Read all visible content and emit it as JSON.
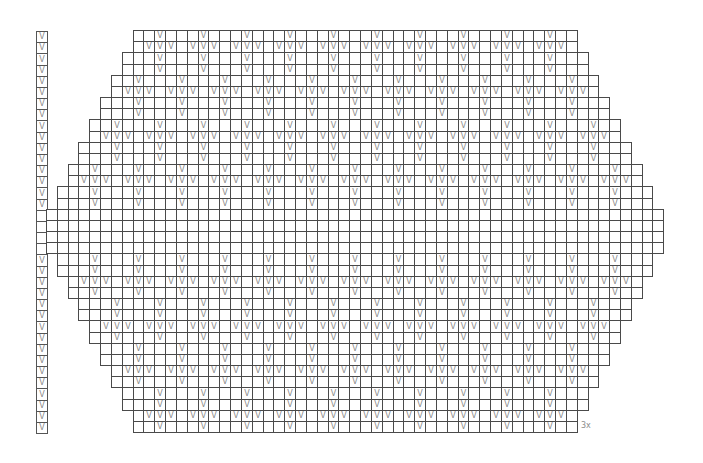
{
  "chart": {
    "title": "",
    "type": "knitting-stitch-chart",
    "cell_symbol": "V",
    "symbol_color": "#8a8a8a",
    "grid_line_color": "#4a4a4a",
    "repeat_label": "3x",
    "geometry": {
      "origin_x": 47,
      "origin_y": 31,
      "cell_w": 10.83,
      "cell_h": 11.17,
      "side_column_x": 36,
      "total_cols": 57,
      "total_rows": 36
    },
    "side_column": {
      "rows_with_v": [
        0,
        1,
        2,
        3,
        4,
        5,
        6,
        7,
        8,
        9,
        10,
        11,
        12,
        13,
        14,
        15,
        20,
        21,
        22,
        23,
        24,
        25,
        26,
        27,
        28,
        29,
        30,
        31,
        32,
        33,
        34,
        35
      ],
      "blank_rows": [
        16,
        17,
        18,
        19
      ]
    },
    "rows": [
      {
        "r": 0,
        "start": 8,
        "end": 48,
        "v": [
          10,
          14,
          18,
          22,
          26,
          30,
          34,
          38,
          42,
          46
        ]
      },
      {
        "r": 1,
        "start": 8,
        "end": 48,
        "v": [
          9,
          10,
          11,
          13,
          14,
          15,
          17,
          18,
          19,
          21,
          22,
          23,
          25,
          26,
          27,
          29,
          30,
          31,
          33,
          34,
          35,
          37,
          38,
          39,
          41,
          42,
          43,
          45,
          46,
          47
        ]
      },
      {
        "r": 2,
        "start": 7,
        "end": 49,
        "v": [
          10,
          14,
          18,
          22,
          26,
          30,
          34,
          38,
          42,
          46
        ]
      },
      {
        "r": 3,
        "start": 7,
        "end": 49,
        "v": [
          10,
          14,
          18,
          22,
          26,
          30,
          34,
          38,
          42,
          46
        ]
      },
      {
        "r": 4,
        "start": 6,
        "end": 50,
        "v": [
          8,
          12,
          16,
          20,
          24,
          28,
          32,
          36,
          40,
          44,
          48
        ]
      },
      {
        "r": 5,
        "start": 6,
        "end": 50,
        "v": [
          7,
          8,
          9,
          11,
          12,
          13,
          15,
          16,
          17,
          19,
          20,
          21,
          23,
          24,
          25,
          27,
          28,
          29,
          31,
          32,
          33,
          35,
          36,
          37,
          39,
          40,
          41,
          43,
          44,
          45,
          47,
          48,
          49
        ]
      },
      {
        "r": 6,
        "start": 5,
        "end": 51,
        "v": [
          8,
          12,
          16,
          20,
          24,
          28,
          32,
          36,
          40,
          44,
          48
        ]
      },
      {
        "r": 7,
        "start": 5,
        "end": 51,
        "v": [
          8,
          12,
          16,
          20,
          24,
          28,
          32,
          36,
          40,
          44,
          48
        ]
      },
      {
        "r": 8,
        "start": 4,
        "end": 52,
        "v": [
          6,
          10,
          14,
          18,
          22,
          26,
          30,
          34,
          38,
          42,
          46,
          50
        ]
      },
      {
        "r": 9,
        "start": 4,
        "end": 52,
        "v": [
          5,
          6,
          7,
          9,
          10,
          11,
          13,
          14,
          15,
          17,
          18,
          19,
          21,
          22,
          23,
          25,
          26,
          27,
          29,
          30,
          31,
          33,
          34,
          35,
          37,
          38,
          39,
          41,
          42,
          43,
          45,
          46,
          47,
          49,
          50,
          51
        ]
      },
      {
        "r": 10,
        "start": 3,
        "end": 53,
        "v": [
          6,
          10,
          14,
          18,
          22,
          26,
          30,
          34,
          38,
          42,
          46,
          50
        ]
      },
      {
        "r": 11,
        "start": 3,
        "end": 53,
        "v": [
          6,
          10,
          14,
          18,
          22,
          26,
          30,
          34,
          38,
          42,
          46,
          50
        ]
      },
      {
        "r": 12,
        "start": 2,
        "end": 54,
        "v": [
          4,
          8,
          12,
          16,
          20,
          24,
          28,
          32,
          36,
          40,
          44,
          48,
          52
        ]
      },
      {
        "r": 13,
        "start": 2,
        "end": 54,
        "v": [
          3,
          4,
          5,
          7,
          8,
          9,
          11,
          12,
          13,
          15,
          16,
          17,
          19,
          20,
          21,
          23,
          24,
          25,
          27,
          28,
          29,
          31,
          32,
          33,
          35,
          36,
          37,
          39,
          40,
          41,
          43,
          44,
          45,
          47,
          48,
          49,
          51,
          52,
          53
        ]
      },
      {
        "r": 14,
        "start": 1,
        "end": 55,
        "v": [
          4,
          8,
          12,
          16,
          20,
          24,
          28,
          32,
          36,
          40,
          44,
          48,
          52
        ]
      },
      {
        "r": 15,
        "start": 1,
        "end": 55,
        "v": [
          4,
          8,
          12,
          16,
          20,
          24,
          28,
          32,
          36,
          40,
          44,
          48,
          52
        ]
      },
      {
        "r": 16,
        "start": 0,
        "end": 56,
        "v": []
      },
      {
        "r": 17,
        "start": 0,
        "end": 56,
        "v": []
      },
      {
        "r": 18,
        "start": 0,
        "end": 56,
        "v": []
      },
      {
        "r": 19,
        "start": 0,
        "end": 56,
        "v": []
      },
      {
        "r": 20,
        "start": 1,
        "end": 55,
        "v": [
          4,
          8,
          12,
          16,
          20,
          24,
          28,
          32,
          36,
          40,
          44,
          48,
          52
        ]
      },
      {
        "r": 21,
        "start": 1,
        "end": 55,
        "v": [
          4,
          8,
          12,
          16,
          20,
          24,
          28,
          32,
          36,
          40,
          44,
          48,
          52
        ]
      },
      {
        "r": 22,
        "start": 2,
        "end": 54,
        "v": [
          3,
          4,
          5,
          7,
          8,
          9,
          11,
          12,
          13,
          15,
          16,
          17,
          19,
          20,
          21,
          23,
          24,
          25,
          27,
          28,
          29,
          31,
          32,
          33,
          35,
          36,
          37,
          39,
          40,
          41,
          43,
          44,
          45,
          47,
          48,
          49,
          51,
          52,
          53
        ]
      },
      {
        "r": 23,
        "start": 2,
        "end": 54,
        "v": [
          4,
          8,
          12,
          16,
          20,
          24,
          28,
          32,
          36,
          40,
          44,
          48,
          52
        ]
      },
      {
        "r": 24,
        "start": 3,
        "end": 53,
        "v": [
          6,
          10,
          14,
          18,
          22,
          26,
          30,
          34,
          38,
          42,
          46,
          50
        ]
      },
      {
        "r": 25,
        "start": 3,
        "end": 53,
        "v": [
          6,
          10,
          14,
          18,
          22,
          26,
          30,
          34,
          38,
          42,
          46,
          50
        ]
      },
      {
        "r": 26,
        "start": 4,
        "end": 52,
        "v": [
          5,
          6,
          7,
          9,
          10,
          11,
          13,
          14,
          15,
          17,
          18,
          19,
          21,
          22,
          23,
          25,
          26,
          27,
          29,
          30,
          31,
          33,
          34,
          35,
          37,
          38,
          39,
          41,
          42,
          43,
          45,
          46,
          47,
          49,
          50,
          51
        ]
      },
      {
        "r": 27,
        "start": 4,
        "end": 52,
        "v": [
          6,
          10,
          14,
          18,
          22,
          26,
          30,
          34,
          38,
          42,
          46,
          50
        ]
      },
      {
        "r": 28,
        "start": 5,
        "end": 51,
        "v": [
          8,
          12,
          16,
          20,
          24,
          28,
          32,
          36,
          40,
          44,
          48
        ]
      },
      {
        "r": 29,
        "start": 5,
        "end": 51,
        "v": [
          8,
          12,
          16,
          20,
          24,
          28,
          32,
          36,
          40,
          44,
          48
        ]
      },
      {
        "r": 30,
        "start": 6,
        "end": 50,
        "v": [
          7,
          8,
          9,
          11,
          12,
          13,
          15,
          16,
          17,
          19,
          20,
          21,
          23,
          24,
          25,
          27,
          28,
          29,
          31,
          32,
          33,
          35,
          36,
          37,
          39,
          40,
          41,
          43,
          44,
          45,
          47,
          48,
          49
        ]
      },
      {
        "r": 31,
        "start": 6,
        "end": 50,
        "v": [
          8,
          12,
          16,
          20,
          24,
          28,
          32,
          36,
          40,
          44,
          48
        ]
      },
      {
        "r": 32,
        "start": 7,
        "end": 49,
        "v": [
          10,
          14,
          18,
          22,
          26,
          30,
          34,
          38,
          42,
          46
        ]
      },
      {
        "r": 33,
        "start": 7,
        "end": 49,
        "v": [
          10,
          14,
          18,
          22,
          26,
          30,
          34,
          38,
          42,
          46
        ]
      },
      {
        "r": 34,
        "start": 8,
        "end": 48,
        "v": [
          9,
          10,
          11,
          13,
          14,
          15,
          17,
          18,
          19,
          21,
          22,
          23,
          25,
          26,
          27,
          29,
          30,
          31,
          33,
          34,
          35,
          37,
          38,
          39,
          41,
          42,
          43,
          45,
          46,
          47
        ]
      },
      {
        "r": 35,
        "start": 8,
        "end": 48,
        "v": [
          10,
          14,
          18,
          22,
          26,
          30,
          34,
          38,
          42,
          46
        ]
      }
    ]
  }
}
